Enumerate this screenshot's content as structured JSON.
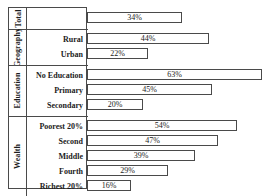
{
  "chart_data": {
    "type": "bar",
    "orientation": "horizontal",
    "title": "",
    "xlabel": "",
    "ylabel": "",
    "xlim": [
      0,
      63
    ],
    "grid": false,
    "legend": false,
    "value_suffix": "%",
    "groups": [
      {
        "name": "Total",
        "categories": [
          "Total"
        ],
        "values": [
          34
        ],
        "labels": [
          "34%"
        ],
        "show_row_labels": false
      },
      {
        "name": "Geography",
        "categories": [
          "Rural",
          "Urban"
        ],
        "values": [
          44,
          22
        ],
        "labels": [
          "44%",
          "22%"
        ],
        "show_row_labels": true
      },
      {
        "name": "Education",
        "categories": [
          "No Education",
          "Primary",
          "Secondary"
        ],
        "values": [
          63,
          45,
          20
        ],
        "labels": [
          "63%",
          "45%",
          "20%"
        ],
        "show_row_labels": true
      },
      {
        "name": "Wealth",
        "categories": [
          "Poorest 20%",
          "Second",
          "Middle",
          "Fourth",
          "Richest 20%"
        ],
        "values": [
          54,
          47,
          39,
          29,
          16
        ],
        "labels": [
          "54%",
          "47%",
          "39%",
          "29%",
          "16%"
        ],
        "show_row_labels": true
      }
    ],
    "categories": [
      "Total",
      "Rural",
      "Urban",
      "No Education",
      "Primary",
      "Secondary",
      "Poorest 20%",
      "Second",
      "Middle",
      "Fourth",
      "Richest 20%"
    ],
    "values": [
      34,
      44,
      22,
      63,
      45,
      20,
      54,
      47,
      39,
      29,
      16
    ],
    "colors": {
      "bar_fill": "#ffffff",
      "bar_stroke": "#4a4a4a",
      "frame": "#4a4a4a",
      "text": "#1c1c1c",
      "background": "#ffffff"
    }
  },
  "group_titles": {
    "total": "Total",
    "geography": "Geography",
    "education": "Education",
    "wealth": "Wealth"
  }
}
